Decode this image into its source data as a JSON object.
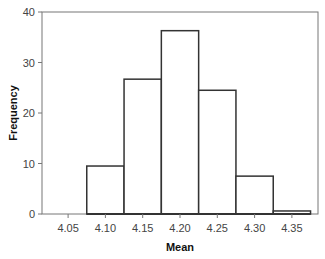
{
  "chart_data": {
    "type": "bar",
    "subtype": "histogram",
    "title": "",
    "xlabel": "Mean",
    "ylabel": "Frequency",
    "x_ticks": [
      "4.05",
      "4.10",
      "4.15",
      "4.20",
      "4.25",
      "4.30",
      "4.35"
    ],
    "y_ticks": [
      "0",
      "10",
      "20",
      "30",
      "40"
    ],
    "ylim": [
      0,
      40
    ],
    "xlim": [
      4.015,
      4.385
    ],
    "bin_width": 0.05,
    "categories": [
      "4.10",
      "4.15",
      "4.20",
      "4.25",
      "4.30",
      "4.35"
    ],
    "values": [
      9.5,
      26.7,
      36.3,
      24.5,
      7.5,
      0.6
    ],
    "grid": false,
    "legend": null,
    "bar_fill": "#ffffff",
    "bar_stroke": "#333333"
  }
}
